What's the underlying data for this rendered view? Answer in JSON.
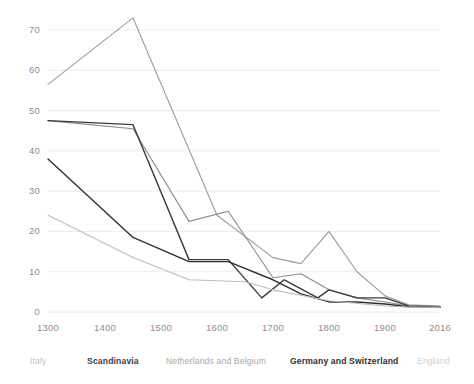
{
  "chart_data": {
    "type": "line",
    "title": "",
    "subtitle": "",
    "xlabel": "",
    "ylabel": "",
    "xlim": [
      1300,
      2016
    ],
    "ylim": [
      0,
      75
    ],
    "grid": true,
    "grid_axis": "y",
    "legend_position": "bottom",
    "yticks": [
      0,
      10,
      20,
      30,
      40,
      50,
      60,
      70
    ],
    "ytick_labels": [
      "0",
      "10",
      "20",
      "30",
      "40",
      "50",
      "60",
      "70"
    ],
    "xticks": [
      1300,
      1400,
      1500,
      1600,
      1700,
      1800,
      1900,
      2016
    ],
    "xtick_labels": [
      "1300",
      "1400",
      "1500",
      "1600",
      "1700",
      "1800",
      "1900",
      "2016"
    ],
    "series": [
      {
        "name": "England",
        "color": "#9b9b9b",
        "width": 1.1,
        "x": [
          1300,
          1450,
          1600,
          1700,
          1750,
          1800,
          1850,
          1900,
          1950,
          2016
        ],
        "y": [
          56.5,
          73,
          24,
          13.5,
          12,
          20,
          10,
          4,
          1.8,
          1.5
        ]
      },
      {
        "name": "Netherlands and Belgium",
        "color": "#8a8a8a",
        "width": 1.1,
        "x": [
          1300,
          1450,
          1550,
          1620,
          1700,
          1750,
          1800,
          1850,
          1900,
          1950,
          2016
        ],
        "y": [
          47.5,
          45.5,
          22.5,
          25,
          8.5,
          9.5,
          5.5,
          3.5,
          2.5,
          1.5,
          1.3
        ]
      },
      {
        "name": "Scandinavia",
        "color": "#3b3b3b",
        "width": 1.4,
        "x": [
          1300,
          1450,
          1550,
          1620,
          1680,
          1720,
          1780,
          1800,
          1850,
          1900,
          1950,
          2016
        ],
        "y": [
          47.5,
          46.5,
          13,
          13,
          3.5,
          8,
          3.5,
          5.5,
          3.5,
          3.5,
          1.5,
          1.3
        ]
      },
      {
        "name": "Germany and Switzerland",
        "color": "#2f2f2f",
        "width": 1.4,
        "x": [
          1300,
          1450,
          1550,
          1620,
          1700,
          1750,
          1800,
          1850,
          1900,
          1950,
          2016
        ],
        "y": [
          38,
          18.5,
          12.5,
          12.5,
          8,
          4.5,
          2.5,
          2.5,
          2,
          1.3,
          1.2
        ]
      },
      {
        "name": "Italy",
        "color": "#bcbcbc",
        "width": 1.1,
        "x": [
          1300,
          1450,
          1550,
          1650,
          1700,
          1800,
          1900,
          1950,
          2016
        ],
        "y": [
          24,
          13.5,
          8,
          7.5,
          5.5,
          2.8,
          1.5,
          1.2,
          1.2
        ]
      }
    ]
  },
  "legend": {
    "items": [
      {
        "label": "Italy",
        "color": "#c2c2c2",
        "weight": "400",
        "x": 30
      },
      {
        "label": "Scandinavia",
        "color": "#3d3d3d",
        "weight": "700",
        "x": 87
      },
      {
        "label": "Netherlands and Belgium",
        "color": "#a7a7a7",
        "weight": "400",
        "x": 166
      },
      {
        "label": "Germany and Switzerland",
        "color": "#2f2f2f",
        "weight": "700",
        "x": 290
      },
      {
        "label": "England",
        "color": "#cfcfcf",
        "weight": "400",
        "x": 417
      }
    ]
  },
  "axes": {
    "grid_color": "#ececec",
    "tick_color": "#8d8d93"
  }
}
